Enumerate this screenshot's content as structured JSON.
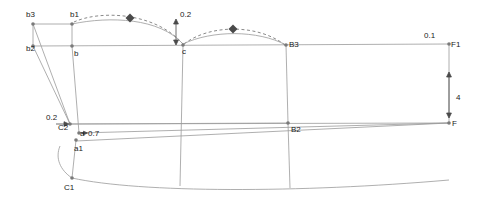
{
  "diagram": {
    "type": "pattern-draft",
    "background": "#ffffff",
    "line_color": "#8c8c8c",
    "dark_line_color": "#6b6b6b",
    "point_color": "#7a7a7a",
    "marker_color": "#4a4a4a",
    "text_color": "#1a1a1a",
    "labels": [
      {
        "name": "label-b3",
        "text": "b3",
        "x": 26,
        "y": 11
      },
      {
        "name": "label-b1",
        "text": "b1",
        "x": 70,
        "y": 11
      },
      {
        "name": "label-0-2-top",
        "text": "0.2",
        "x": 180,
        "y": 11
      },
      {
        "name": "label-b2",
        "text": "b2",
        "x": 26,
        "y": 45
      },
      {
        "name": "label-b-lower",
        "text": "b",
        "x": 74,
        "y": 50
      },
      {
        "name": "label-c",
        "text": "c",
        "x": 182,
        "y": 48
      },
      {
        "name": "label-B3",
        "text": "B3",
        "x": 289,
        "y": 41
      },
      {
        "name": "label-0-1",
        "text": "0.1",
        "x": 424,
        "y": 32
      },
      {
        "name": "label-F1",
        "text": "F1",
        "x": 451,
        "y": 41
      },
      {
        "name": "label-4",
        "text": "4",
        "x": 456,
        "y": 94
      },
      {
        "name": "label-F",
        "text": "F",
        "x": 452,
        "y": 120
      },
      {
        "name": "label-0-2-left",
        "text": "0.2",
        "x": 46,
        "y": 114
      },
      {
        "name": "label-C2",
        "text": "C2",
        "x": 58,
        "y": 124
      },
      {
        "name": "label-a",
        "text": "a",
        "x": 80,
        "y": 130
      },
      {
        "name": "label-0-7",
        "text": "0.7",
        "x": 88,
        "y": 130
      },
      {
        "name": "label-a1",
        "text": "a1",
        "x": 74,
        "y": 145
      },
      {
        "name": "label-B2",
        "text": "B2",
        "x": 291,
        "y": 126
      },
      {
        "name": "label-C1",
        "text": "C1",
        "x": 64,
        "y": 184
      }
    ],
    "points": [
      {
        "name": "point-b3",
        "x": 33,
        "y": 24
      },
      {
        "name": "point-b1",
        "x": 72,
        "y": 24
      },
      {
        "name": "point-b2",
        "x": 33,
        "y": 46
      },
      {
        "name": "point-b",
        "x": 72,
        "y": 46
      },
      {
        "name": "point-c",
        "x": 183,
        "y": 46
      },
      {
        "name": "point-B3",
        "x": 286,
        "y": 45
      },
      {
        "name": "point-F1",
        "x": 449,
        "y": 44
      },
      {
        "name": "point-F",
        "x": 449,
        "y": 123
      },
      {
        "name": "point-C2",
        "x": 70,
        "y": 124
      },
      {
        "name": "point-a",
        "x": 79,
        "y": 133
      },
      {
        "name": "point-a1",
        "x": 76,
        "y": 140
      },
      {
        "name": "point-B2",
        "x": 288,
        "y": 123
      },
      {
        "name": "point-C1",
        "x": 72,
        "y": 178
      }
    ],
    "markers": [
      {
        "name": "diamond-marker-left",
        "x": 130,
        "y": 18
      },
      {
        "name": "diamond-marker-right",
        "x": 233,
        "y": 29
      }
    ],
    "arrows": [
      {
        "name": "arrow-0-2-top",
        "x1": 176,
        "y1": 20,
        "x2": 176,
        "y2": 44
      },
      {
        "name": "arrow-4-vertical",
        "x1": 449,
        "y1": 72,
        "x2": 449,
        "y2": 118
      },
      {
        "name": "arrow-0-2-left",
        "x1": 55,
        "y1": 124,
        "x2": 68,
        "y2": 124
      },
      {
        "name": "arrow-0-7",
        "x1": 80,
        "y1": 133,
        "x2": 86,
        "y2": 133
      }
    ]
  }
}
